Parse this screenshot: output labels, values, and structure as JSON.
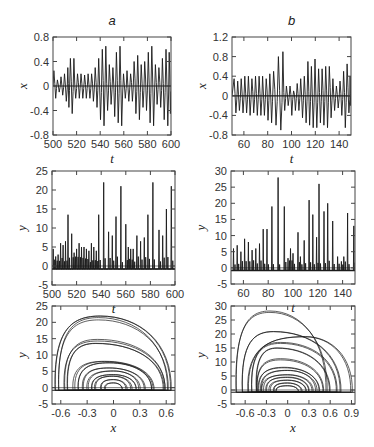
{
  "figure": {
    "width": 374,
    "height": 447,
    "line_color": "#1a1a1a",
    "axis_color": "#444444"
  },
  "chart_data": [
    {
      "id": "a-top",
      "panel_label": "a",
      "type": "line",
      "title": "a",
      "xlabel": "t",
      "ylabel": "x",
      "xlim": [
        500,
        600
      ],
      "ylim": [
        -0.8,
        0.8
      ],
      "xticks": [
        500,
        520,
        540,
        560,
        580,
        600
      ],
      "yticks": [
        -0.8,
        -0.4,
        0,
        0.4,
        0.8
      ],
      "ytick_labels": [
        "-0.8",
        "-0.4",
        "0",
        "0.4",
        "0.8"
      ],
      "box": [
        53,
        37,
        171,
        135
      ],
      "zero_line": true,
      "description": "Chaotic oscillation of x(t) with growing/shrinking amplitude envelope",
      "peaks": {
        "t": [
          500,
          503,
          506,
          509,
          512,
          514,
          517,
          520,
          523,
          526,
          529,
          532,
          535,
          538,
          541,
          544,
          547,
          550,
          553,
          556,
          559,
          562,
          565,
          568,
          571,
          574,
          577,
          580,
          583,
          586,
          589,
          592,
          595,
          598
        ],
        "max": [
          0.25,
          0.1,
          0.15,
          0.2,
          0.3,
          0.45,
          0.45,
          0.2,
          0.2,
          0.18,
          0.2,
          0.2,
          0.3,
          0.45,
          0.6,
          0.65,
          0.35,
          0.3,
          0.55,
          0.65,
          0.2,
          0.25,
          0.2,
          0.4,
          0.5,
          0.35,
          0.4,
          0.55,
          0.65,
          0.35,
          0.3,
          0.45,
          0.6,
          0.55
        ],
        "min": [
          -0.2,
          -0.1,
          -0.15,
          -0.25,
          -0.35,
          -0.45,
          -0.2,
          -0.2,
          -0.2,
          -0.2,
          -0.2,
          -0.25,
          -0.35,
          -0.55,
          -0.65,
          -0.4,
          -0.3,
          -0.5,
          -0.6,
          -0.65,
          -0.2,
          -0.25,
          -0.25,
          -0.45,
          -0.55,
          -0.35,
          -0.4,
          -0.6,
          -0.65,
          -0.3,
          -0.35,
          -0.55,
          -0.65,
          -0.45
        ]
      }
    },
    {
      "id": "b-top",
      "panel_label": "b",
      "type": "line",
      "title": "b",
      "xlabel": "t",
      "ylabel": "x",
      "xlim": [
        50,
        150
      ],
      "ylim": [
        -0.8,
        1.2
      ],
      "xticks": [
        60,
        80,
        100,
        120,
        140
      ],
      "yticks": [
        -0.8,
        -0.4,
        0,
        0.4,
        0.8,
        1.2
      ],
      "ytick_labels": [
        "-0.8",
        "-0.4",
        "0",
        "0.4",
        "0.8",
        "1.2"
      ],
      "box": [
        232,
        37,
        351,
        135
      ],
      "zero_line": true,
      "description": "Chaotic oscillation of x(t); largest peaks near t=88 (~0.8) and t=92 (~0.9)",
      "peaks": {
        "t": [
          51,
          54,
          57,
          60,
          63,
          66,
          69,
          72,
          75,
          78,
          81,
          84,
          88,
          92,
          95,
          98,
          101,
          104,
          107,
          110,
          113,
          116,
          119,
          122,
          125,
          128,
          131,
          134,
          137,
          140,
          143,
          146,
          149
        ],
        "max": [
          0.35,
          0.3,
          0.35,
          0.4,
          0.4,
          0.35,
          0.4,
          0.4,
          0.4,
          0.35,
          0.45,
          0.5,
          0.8,
          0.9,
          0.2,
          0.2,
          0.1,
          0.25,
          0.35,
          0.4,
          0.7,
          0.6,
          0.75,
          0.55,
          0.55,
          0.6,
          0.6,
          0.35,
          0.2,
          0.3,
          0.5,
          0.65,
          0.4
        ],
        "min": [
          -0.35,
          -0.3,
          -0.35,
          -0.35,
          -0.4,
          -0.35,
          -0.4,
          -0.4,
          -0.4,
          -0.5,
          -0.55,
          -0.6,
          -0.7,
          -0.3,
          -0.2,
          -0.4,
          -0.3,
          -0.3,
          -0.45,
          -0.55,
          -0.6,
          -0.65,
          -0.65,
          -0.55,
          -0.6,
          -0.65,
          -0.45,
          -0.3,
          -0.25,
          -0.4,
          -0.65,
          -0.35,
          -0.2
        ]
      }
    },
    {
      "id": "a-middle",
      "panel_label": "a",
      "type": "line",
      "title": "",
      "xlabel": "t",
      "ylabel": "y",
      "xlim": [
        500,
        600
      ],
      "ylim": [
        -5,
        25
      ],
      "xticks": [
        500,
        520,
        540,
        560,
        580,
        600
      ],
      "yticks": [
        -5,
        0,
        5,
        10,
        15,
        20,
        25
      ],
      "ytick_labels": [
        "-5",
        "0",
        "5",
        "10",
        "15",
        "20",
        "25"
      ],
      "box": [
        52,
        171,
        175,
        285
      ],
      "baseline": -0.8,
      "description": "Spiking y(t): narrow spikes from baseline ~-0.8",
      "spikes": {
        "t": [
          501,
          503,
          505,
          507,
          509,
          511,
          513,
          516,
          518,
          520,
          522,
          524,
          526,
          528,
          530,
          532,
          534,
          536,
          538,
          542,
          546,
          549,
          552,
          556,
          560,
          562,
          564,
          566,
          569,
          572,
          575,
          578,
          582,
          587,
          590,
          593,
          597
        ],
        "height": [
          4.5,
          2.5,
          3.0,
          6.0,
          5.5,
          6.5,
          13.5,
          8.5,
          3.5,
          4.5,
          6.0,
          5.0,
          5.0,
          4.5,
          4.0,
          6.0,
          5.0,
          4.0,
          13.5,
          22.0,
          9.0,
          8.0,
          13.0,
          21.0,
          11.0,
          5.0,
          4.5,
          4.5,
          8.0,
          6.5,
          7.5,
          13.5,
          22.0,
          9.5,
          8.0,
          15.0,
          21.0
        ]
      }
    },
    {
      "id": "b-middle",
      "panel_label": "b",
      "type": "line",
      "title": "",
      "xlabel": "t",
      "ylabel": "y",
      "xlim": [
        50,
        150
      ],
      "ylim": [
        -5,
        30
      ],
      "xticks": [
        60,
        80,
        100,
        120,
        140
      ],
      "yticks": [
        -5,
        0,
        5,
        10,
        15,
        20,
        25,
        30
      ],
      "ytick_labels": [
        "-5",
        "0",
        "5",
        "10",
        "15",
        "20",
        "25",
        "30"
      ],
      "box": [
        231,
        171,
        355,
        284
      ],
      "baseline": -0.8,
      "description": "Spiking y(t): tallest spike ~28 near t=88",
      "spikes": {
        "t": [
          52,
          55,
          58,
          61,
          64,
          67,
          70,
          73,
          76,
          79,
          83,
          88,
          93,
          96,
          98,
          100,
          104,
          106,
          109,
          113,
          116,
          119,
          121,
          125,
          128,
          132,
          136,
          139,
          141,
          144,
          149
        ],
        "height": [
          6.0,
          7.0,
          5.0,
          9.0,
          8.0,
          5.5,
          6.0,
          7.5,
          12.0,
          12.0,
          19.0,
          28.0,
          19.0,
          3.0,
          6.0,
          4.5,
          11.0,
          3.5,
          8.5,
          21.0,
          16.5,
          9.5,
          26.0,
          17.5,
          20.0,
          14.5,
          3.5,
          2.0,
          3.5,
          17.0,
          13.0
        ]
      }
    },
    {
      "id": "a-bottom",
      "panel_label": "a",
      "type": "line",
      "title": "",
      "xlabel": "x",
      "ylabel": "y",
      "xlim": [
        -0.7,
        0.7
      ],
      "ylim": [
        -5,
        25
      ],
      "xticks": [
        -0.6,
        -0.3,
        0,
        0.3,
        0.6
      ],
      "xtick_labels": [
        "-0.6",
        "-0.3",
        "0",
        "0.3",
        "0.6"
      ],
      "yticks": [
        -5,
        0,
        5,
        10,
        15,
        20,
        25
      ],
      "ytick_labels": [
        "-5",
        "0",
        "5",
        "10",
        "15",
        "20",
        "25"
      ],
      "box": [
        52,
        306,
        175,
        404
      ],
      "description": "Phase portrait y vs x: nested arch-shaped loops with floor near y=-0.8",
      "loops": {
        "left": [
          -0.65,
          -0.63,
          -0.55,
          -0.52,
          -0.45,
          -0.4,
          -0.35,
          -0.3,
          -0.25,
          -0.2,
          -0.15,
          -0.1
        ],
        "right": [
          0.65,
          0.62,
          0.6,
          0.58,
          0.45,
          0.42,
          0.35,
          0.3,
          0.25,
          0.2,
          0.15,
          0.1
        ],
        "peak": [
          22,
          21,
          14.5,
          13.5,
          8,
          7.5,
          6,
          5,
          4,
          3.5,
          2.5,
          1.5
        ],
        "peak_x": [
          -0.15,
          -0.17,
          -0.18,
          -0.2,
          -0.1,
          -0.05,
          -0.05,
          0,
          0,
          0,
          0,
          0
        ]
      }
    },
    {
      "id": "b-bottom",
      "panel_label": "b",
      "type": "line",
      "title": "",
      "xlabel": "x",
      "ylabel": "y",
      "xlim": [
        -0.8,
        0.95
      ],
      "ylim": [
        -5,
        30
      ],
      "xticks": [
        -0.6,
        -0.3,
        0,
        0.3,
        0.6,
        0.9
      ],
      "xtick_labels": [
        "-0.6",
        "-0.3",
        "0",
        "0.3",
        "0.6",
        "0.9"
      ],
      "yticks": [
        -5,
        0,
        5,
        10,
        15,
        20,
        25,
        30
      ],
      "ytick_labels": [
        "-5",
        "0",
        "5",
        "10",
        "15",
        "20",
        "25",
        "30"
      ],
      "box": [
        231,
        306,
        355,
        404
      ],
      "description": "Phase portrait y vs x: nested arches, largest reaching y~28 and right edge x~0.9",
      "loops": {
        "left": [
          -0.72,
          -0.65,
          -0.55,
          -0.5,
          -0.45,
          -0.42,
          -0.4,
          -0.38,
          -0.35,
          -0.3,
          -0.25,
          -0.2,
          -0.15
        ],
        "right": [
          0.55,
          0.75,
          0.9,
          0.7,
          0.6,
          0.5,
          0.45,
          0.4,
          0.35,
          0.3,
          0.25,
          0.2,
          0.15
        ],
        "peak": [
          28,
          21,
          19,
          17,
          15,
          11,
          8,
          7,
          5.5,
          4.5,
          3.5,
          2.5,
          1.5
        ],
        "peak_x": [
          -0.25,
          -0.2,
          0.25,
          -0.1,
          -0.15,
          -0.1,
          -0.05,
          0,
          0,
          0,
          0,
          0,
          0
        ]
      }
    }
  ]
}
